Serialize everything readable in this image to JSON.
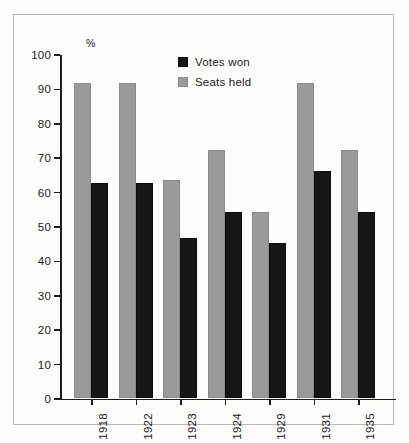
{
  "chart_data": {
    "type": "bar",
    "title": "",
    "subtitle": "",
    "xlabel": "",
    "ylabel": "%",
    "ylim": [
      0,
      100
    ],
    "ytick_step": 10,
    "yticks": [
      0,
      10,
      20,
      30,
      40,
      50,
      60,
      70,
      80,
      90,
      100
    ],
    "grid": false,
    "legend_position": "top-center-inside",
    "bar_order_in_group": [
      "Seats held",
      "Votes won"
    ],
    "categories": [
      "1918",
      "1922",
      "1923",
      "1924",
      "1929",
      "1931",
      "1935"
    ],
    "series": [
      {
        "name": "Seats held",
        "color": "#9a9a98",
        "values": [
          91.5,
          91.5,
          63.5,
          72,
          54,
          91.5,
          72
        ]
      },
      {
        "name": "Votes won",
        "color": "#161616",
        "values": [
          62.5,
          62.5,
          46.5,
          54,
          45,
          66,
          54
        ]
      }
    ]
  },
  "legend": {
    "items": [
      {
        "label": "Votes won",
        "swatch": "black-square-swatch"
      },
      {
        "label": "Seats held",
        "swatch": "gray-square-swatch"
      }
    ]
  },
  "axis": {
    "y_unit_label": "%",
    "y_tick_labels": [
      "100",
      "90",
      "80",
      "70",
      "60",
      "50",
      "40",
      "30",
      "20",
      "10",
      "0"
    ],
    "x_tick_labels": [
      "1918",
      "1922",
      "1923",
      "1924",
      "1929",
      "1931",
      "1935"
    ]
  },
  "colors": {
    "seats_held": "#9a9a98",
    "votes_won": "#161616",
    "axis": "#1d1d1d",
    "frame": "#b9b9b7",
    "background": "#fdfdfc"
  }
}
